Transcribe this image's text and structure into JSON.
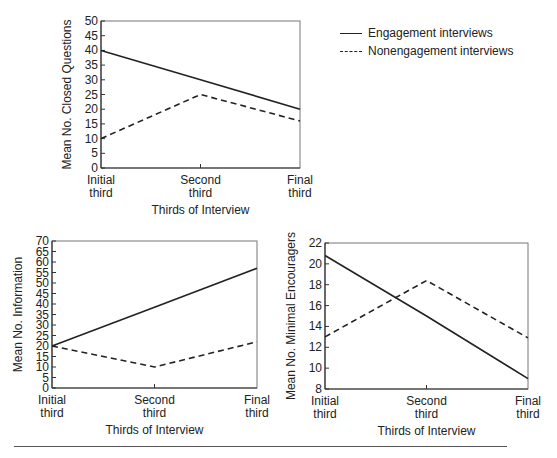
{
  "legend": {
    "items": [
      {
        "label": "Engagement interviews",
        "style": "solid"
      },
      {
        "label": "Nonengagement interviews",
        "style": "dashed"
      }
    ]
  },
  "chart_data": [
    {
      "type": "line",
      "title": "",
      "xlabel": "Thirds of Interview",
      "ylabel": "Mean No. Closed Questions",
      "categories": [
        "Initial third",
        "Second third",
        "Final third"
      ],
      "category_lines": [
        [
          "Initial",
          "third"
        ],
        [
          "Second",
          "third"
        ],
        [
          "Final",
          "third"
        ]
      ],
      "ylim": [
        0,
        50
      ],
      "yticks": [
        0,
        5,
        10,
        15,
        20,
        25,
        30,
        35,
        40,
        45,
        50
      ],
      "grid": false,
      "series": [
        {
          "name": "Engagement interviews",
          "style": "solid",
          "values": [
            40,
            30,
            20
          ]
        },
        {
          "name": "Nonengagement interviews",
          "style": "dashed",
          "values": [
            10,
            25,
            16
          ]
        }
      ],
      "layout": {
        "x0": 101,
        "x1": 300,
        "y0": 168,
        "y1": 21
      }
    },
    {
      "type": "line",
      "title": "",
      "xlabel": "Thirds of Interview",
      "ylabel": "Mean No. Information",
      "categories": [
        "Initial third",
        "Second third",
        "Final third"
      ],
      "category_lines": [
        [
          "Initial",
          "third"
        ],
        [
          "Second",
          "third"
        ],
        [
          "Final",
          "third"
        ]
      ],
      "ylim": [
        0,
        70
      ],
      "yticks": [
        0,
        5,
        10,
        15,
        20,
        25,
        30,
        35,
        40,
        45,
        50,
        55,
        60,
        65,
        70
      ],
      "grid": false,
      "series": [
        {
          "name": "Engagement interviews",
          "style": "solid",
          "values": [
            20,
            38.5,
            57
          ]
        },
        {
          "name": "Nonengagement interviews",
          "style": "dashed",
          "values": [
            20,
            10,
            22
          ]
        }
      ],
      "layout": {
        "x0": 52,
        "x1": 257,
        "y0": 388,
        "y1": 241
      }
    },
    {
      "type": "line",
      "title": "",
      "xlabel": "Thirds of Interview",
      "ylabel": "Mean No. Minimal Encouragers",
      "categories": [
        "Initial third",
        "Second third",
        "Final third"
      ],
      "category_lines": [
        [
          "Initial",
          "third"
        ],
        [
          "Second",
          "third"
        ],
        [
          "Final",
          "third"
        ]
      ],
      "ylim": [
        8,
        22
      ],
      "yticks": [
        8,
        10,
        12,
        14,
        16,
        18,
        20,
        22
      ],
      "grid": false,
      "series": [
        {
          "name": "Engagement interviews",
          "style": "solid",
          "values": [
            20.8,
            15,
            9
          ]
        },
        {
          "name": "Nonengagement interviews",
          "style": "dashed",
          "values": [
            13,
            18.4,
            12.9
          ]
        }
      ],
      "layout": {
        "x0": 325,
        "x1": 528,
        "y0": 389,
        "y1": 243
      }
    }
  ]
}
